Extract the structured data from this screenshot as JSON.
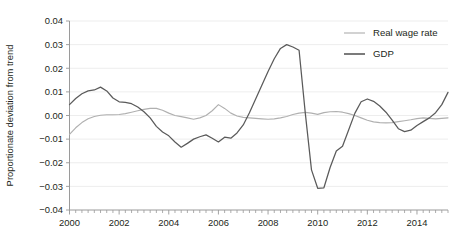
{
  "chart_data": {
    "type": "line",
    "title": "",
    "xlabel": "",
    "ylabel": "Proportionate deviation from trend",
    "xlim": [
      2000,
      2015.25
    ],
    "ylim": [
      -0.04,
      0.04
    ],
    "grid": true,
    "legend_position": "top-right",
    "y_ticks": [
      "0.04",
      "0.03",
      "0.02",
      "0.01",
      "0.00",
      "-0.01",
      "-0.02",
      "-0.03",
      "-0.04"
    ],
    "y_tick_values": [
      0.04,
      0.03,
      0.02,
      0.01,
      0.0,
      -0.01,
      -0.02,
      -0.03,
      -0.04
    ],
    "x_ticks": [
      "2000",
      "2002",
      "2004",
      "2006",
      "2008",
      "2010",
      "2012",
      "2014"
    ],
    "x_tick_values": [
      2000,
      2002,
      2004,
      2006,
      2008,
      2010,
      2012,
      2014
    ],
    "x_minor_step": 0.25,
    "series": [
      {
        "name": "Real wage rate",
        "color": "#b0b0b0",
        "x": [
          2000.0,
          2000.25,
          2000.5,
          2000.75,
          2001.0,
          2001.25,
          2001.5,
          2001.75,
          2002.0,
          2002.25,
          2002.5,
          2002.75,
          2003.0,
          2003.25,
          2003.5,
          2003.75,
          2004.0,
          2004.25,
          2004.5,
          2004.75,
          2005.0,
          2005.25,
          2005.5,
          2005.75,
          2006.0,
          2006.25,
          2006.5,
          2006.75,
          2007.0,
          2007.25,
          2007.5,
          2007.75,
          2008.0,
          2008.25,
          2008.5,
          2008.75,
          2009.0,
          2009.25,
          2009.5,
          2009.75,
          2010.0,
          2010.25,
          2010.5,
          2010.75,
          2011.0,
          2011.25,
          2011.5,
          2011.75,
          2012.0,
          2012.25,
          2012.5,
          2012.75,
          2013.0,
          2013.25,
          2013.5,
          2013.75,
          2014.0,
          2014.25,
          2014.5,
          2014.75,
          2015.0,
          2015.25
        ],
        "y": [
          -0.008,
          -0.0052,
          -0.003,
          -0.0014,
          -0.0004,
          0.0001,
          0.0003,
          0.0003,
          0.0004,
          0.0008,
          0.0014,
          0.002,
          0.0026,
          0.003,
          0.003,
          0.0022,
          0.001,
          0.0,
          -0.0005,
          -0.001,
          -0.0016,
          -0.001,
          0.0,
          0.002,
          0.0046,
          0.003,
          0.001,
          -0.0002,
          -0.0008,
          -0.001,
          -0.0012,
          -0.0014,
          -0.0016,
          -0.0014,
          -0.001,
          -0.0004,
          0.0004,
          0.001,
          0.0013,
          0.001,
          0.0005,
          0.0012,
          0.0016,
          0.0017,
          0.0014,
          0.0008,
          0.0,
          -0.001,
          -0.002,
          -0.0027,
          -0.003,
          -0.0031,
          -0.003,
          -0.0026,
          -0.0022,
          -0.0018,
          -0.0013,
          -0.001,
          -0.0012,
          -0.0014,
          -0.0012,
          -0.001
        ]
      },
      {
        "name": "GDP",
        "color": "#5a5a5a",
        "x": [
          2000.0,
          2000.25,
          2000.5,
          2000.75,
          2001.0,
          2001.25,
          2001.5,
          2001.75,
          2002.0,
          2002.25,
          2002.5,
          2002.75,
          2003.0,
          2003.25,
          2003.5,
          2003.75,
          2004.0,
          2004.25,
          2004.5,
          2004.75,
          2005.0,
          2005.25,
          2005.5,
          2005.75,
          2006.0,
          2006.25,
          2006.5,
          2006.75,
          2007.0,
          2007.25,
          2007.5,
          2007.75,
          2008.0,
          2008.25,
          2008.5,
          2008.75,
          2009.0,
          2009.25,
          2009.5,
          2009.75,
          2010.0,
          2010.25,
          2010.5,
          2010.75,
          2011.0,
          2011.25,
          2011.5,
          2011.75,
          2012.0,
          2012.25,
          2012.5,
          2012.75,
          2013.0,
          2013.25,
          2013.5,
          2013.75,
          2014.0,
          2014.25,
          2014.5,
          2014.75,
          2015.0,
          2015.25
        ],
        "y": [
          0.0046,
          0.0072,
          0.0092,
          0.0104,
          0.0108,
          0.012,
          0.0104,
          0.0074,
          0.0058,
          0.0056,
          0.005,
          0.0036,
          0.0016,
          -0.001,
          -0.0046,
          -0.007,
          -0.0086,
          -0.0112,
          -0.0134,
          -0.0118,
          -0.01,
          -0.009,
          -0.0082,
          -0.0096,
          -0.0112,
          -0.0092,
          -0.0096,
          -0.0074,
          -0.004,
          0.0012,
          0.007,
          0.0128,
          0.0186,
          0.024,
          0.0284,
          0.03,
          0.029,
          0.0276,
          0.001,
          -0.023,
          -0.0308,
          -0.0306,
          -0.022,
          -0.015,
          -0.013,
          -0.006,
          0.001,
          0.0058,
          0.007,
          0.006,
          0.004,
          0.0014,
          -0.002,
          -0.0056,
          -0.0068,
          -0.0062,
          -0.0042,
          -0.0026,
          -0.001,
          0.0012,
          0.0046,
          0.0098
        ]
      }
    ]
  }
}
